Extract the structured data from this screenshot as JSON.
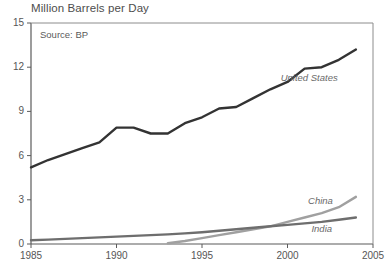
{
  "chart_data": {
    "type": "line",
    "title": "Million Barrels per Day",
    "source_note": "Source: BP",
    "xlabel": "",
    "ylabel": "",
    "xlim": [
      1985,
      2005
    ],
    "ylim": [
      0,
      15
    ],
    "grid": false,
    "legend_position": "inline-right",
    "x_ticks": [
      "1985",
      "1990",
      "1995",
      "2000",
      "2005"
    ],
    "x_tick_values": [
      1985,
      1990,
      1995,
      2000,
      2005
    ],
    "y_ticks": [
      "0",
      "3",
      "6",
      "9",
      "12",
      "15"
    ],
    "y_tick_values": [
      0,
      3,
      6,
      9,
      12,
      15
    ],
    "x": [
      1985,
      1986,
      1987,
      1988,
      1989,
      1990,
      1991,
      1992,
      1993,
      1994,
      1995,
      1996,
      1997,
      1998,
      1999,
      2000,
      2001,
      2002,
      2003,
      2004
    ],
    "series": [
      {
        "name": "United States",
        "color": "#333333",
        "label_x": 1999.6,
        "label_y": 11.3,
        "values": [
          5.2,
          5.7,
          6.1,
          6.5,
          6.9,
          7.9,
          7.9,
          7.5,
          7.5,
          8.2,
          8.6,
          9.2,
          9.3,
          9.9,
          10.5,
          11.0,
          11.9,
          12.0,
          12.5,
          13.2
        ]
      },
      {
        "name": "China",
        "color": "#a0a0a0",
        "label_x": 2001.2,
        "label_y": 2.9,
        "values": [
          null,
          null,
          null,
          null,
          null,
          null,
          null,
          null,
          0.05,
          0.2,
          0.4,
          0.6,
          0.8,
          1.0,
          1.2,
          1.5,
          1.8,
          2.1,
          2.5,
          3.2
        ]
      },
      {
        "name": "India",
        "color": "#6e6e6e",
        "label_x": 2001.4,
        "label_y": 1.05,
        "values": [
          0.25,
          0.3,
          0.35,
          0.4,
          0.45,
          0.5,
          0.55,
          0.6,
          0.65,
          0.72,
          0.8,
          0.9,
          1.0,
          1.1,
          1.2,
          1.3,
          1.4,
          1.5,
          1.65,
          1.8
        ]
      }
    ]
  }
}
